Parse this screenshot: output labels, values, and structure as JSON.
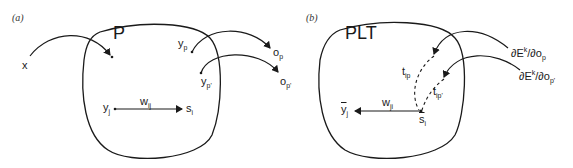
{
  "panels": [
    {
      "tag": "(a)",
      "title": "P",
      "labels": {
        "x": "x",
        "y_p": "y",
        "y_p_sub": "p",
        "y_pp": "y",
        "y_pp_sub": "p'",
        "o_p": "o",
        "o_p_sub": "p",
        "o_pp": "o",
        "o_pp_sub": "p'",
        "y_j": "y",
        "y_j_sub": "j",
        "w_ij": "w",
        "w_ij_sub": "ij",
        "s_i": "s",
        "s_i_sub": "i"
      }
    },
    {
      "tag": "(b)",
      "title": "PLT",
      "labels": {
        "y_bar_j": "y",
        "y_bar_j_sub": "j",
        "w_ji": "w",
        "w_ji_sub": "ji",
        "s_bar_i": "s",
        "s_bar_i_sub": "i",
        "t_ip": "t",
        "t_ip_sub": "ip",
        "t_ipp": "t",
        "t_ipp_sub": "ip'",
        "grad_p": "∂E",
        "grad_p_sup": "k",
        "grad_p_tail": "/∂o",
        "grad_p_sub": "p",
        "grad_pp": "∂E",
        "grad_pp_sup": "k",
        "grad_pp_tail": "/∂o",
        "grad_pp_sub": "p'"
      }
    }
  ],
  "colors": {
    "stroke": "#1a1a1a",
    "background": "#ffffff"
  }
}
